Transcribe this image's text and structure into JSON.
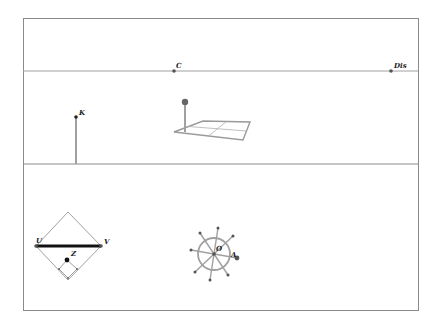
{
  "colors": {
    "frame": "#8a8a8a",
    "line": "#a0a0a0",
    "thick_segment": "#111111",
    "point": "#555555",
    "handle": "#666666",
    "grid": "#9a9a9a"
  },
  "top_panel": {
    "points": [
      {
        "label": "C",
        "x": 174,
        "y": 71
      },
      {
        "label": "Dis",
        "x": 391,
        "y": 71
      }
    ]
  },
  "middle_panel": {
    "point_k": {
      "label": "K",
      "x": 76,
      "y": 117
    },
    "plane_grid": {
      "handle": "sphere-handle"
    }
  },
  "bottom_panel": {
    "diamond": {
      "points": [
        {
          "label": "U",
          "x": 36,
          "y": 246
        },
        {
          "label": "V",
          "x": 101,
          "y": 246
        },
        {
          "label": "Z",
          "x": 67,
          "y": 260
        }
      ]
    },
    "wheel": {
      "points": [
        {
          "label": "O",
          "x": 214,
          "y": 254
        },
        {
          "label": "A",
          "x": 237,
          "y": 258
        }
      ]
    }
  }
}
